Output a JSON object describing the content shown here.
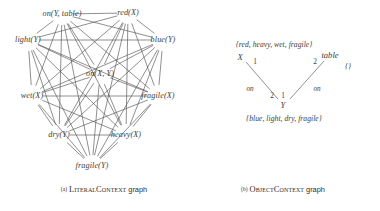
{
  "figure": {
    "width": 380,
    "height": 211,
    "background": "#ffffff",
    "ink": "#3c3c3c"
  },
  "panels": [
    {
      "id": "literal-context",
      "caption_tag": "(a)",
      "caption_name": "LiteralContext",
      "caption_suffix": "graph",
      "caption_x": 104,
      "caption_y": 185
    },
    {
      "id": "object-context",
      "caption_tag": "(b)",
      "caption_name": "ObjectContext",
      "caption_suffix": "graph",
      "caption_x": 283,
      "caption_y": 185
    }
  ],
  "literal_graph": {
    "type": "complete-graph",
    "note": "every node connected to every other node",
    "nodes": [
      {
        "id": "on_y_table",
        "label": "on(Y, table)",
        "x": 62,
        "y": 14
      },
      {
        "id": "red_x",
        "label": "red(X)",
        "x": 128,
        "y": 13
      },
      {
        "id": "blue_y",
        "label": "blue(Y)",
        "x": 163,
        "y": 40
      },
      {
        "id": "fragile_x",
        "label": "fragile(X)",
        "x": 158,
        "y": 96
      },
      {
        "id": "heavy_x",
        "label": "heavy(X)",
        "x": 126,
        "y": 135
      },
      {
        "id": "fragile_y",
        "label": "fragile(Y)",
        "x": 92,
        "y": 166
      },
      {
        "id": "dry_y",
        "label": "dry(Y)",
        "x": 59,
        "y": 135
      },
      {
        "id": "wet_x",
        "label": "wet(X)",
        "x": 32,
        "y": 96
      },
      {
        "id": "light_y",
        "label": "light(Y)",
        "x": 28,
        "y": 40
      },
      {
        "id": "on_x_y",
        "label": "on(X, Y)",
        "x": 100,
        "y": 74
      }
    ]
  },
  "object_graph": {
    "type": "labeled-graph",
    "nodes": [
      {
        "id": "x",
        "label": "X",
        "x": 240,
        "y": 57
      },
      {
        "id": "y",
        "label": "Y",
        "x": 283,
        "y": 105
      },
      {
        "id": "table",
        "label": "table",
        "x": 330,
        "y": 55
      }
    ],
    "sets": [
      {
        "id": "x-set",
        "label": "{red, heavy, wet, fragile}",
        "x": 274,
        "y": 44
      },
      {
        "id": "y-set",
        "label": "{blue, light, dry, fragile}",
        "x": 284,
        "y": 118
      },
      {
        "id": "table-set",
        "label": "{}",
        "x": 348,
        "y": 66
      }
    ],
    "edges": [
      {
        "id": "edge-x-y",
        "from": "x",
        "to": "y",
        "name": "on",
        "from_port": "1",
        "to_port": "2",
        "x1": 246,
        "y1": 62,
        "x2": 278,
        "y2": 99,
        "name_x": 250,
        "name_y": 89,
        "from_port_x": 255,
        "from_port_y": 61,
        "to_port_x": 272,
        "to_port_y": 95
      },
      {
        "id": "edge-table-y",
        "from": "table",
        "to": "y",
        "name": "on",
        "from_port": "2",
        "to_port": "1",
        "x1": 324,
        "y1": 61,
        "x2": 290,
        "y2": 99,
        "name_x": 317,
        "name_y": 89,
        "from_port_x": 315,
        "from_port_y": 61,
        "to_port_x": 283,
        "to_port_y": 95
      }
    ]
  }
}
